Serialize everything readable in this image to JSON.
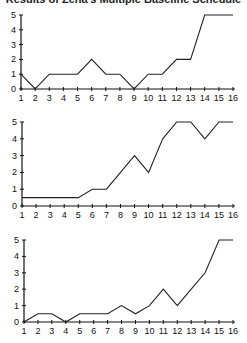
{
  "title": "Results of Zena's Multiple Baseline Schedule",
  "chart_data": [
    {
      "type": "line",
      "title": "",
      "xlabel": "",
      "ylabel": "",
      "x": [
        1,
        2,
        3,
        4,
        5,
        6,
        7,
        8,
        9,
        10,
        11,
        12,
        13,
        14,
        15,
        16
      ],
      "values": [
        1,
        0,
        1,
        1,
        1,
        2,
        1,
        1,
        0,
        1,
        1,
        2,
        2,
        5,
        5,
        5
      ],
      "ylim": [
        0,
        5
      ],
      "yticks": [
        0,
        1,
        2,
        3,
        4,
        5
      ],
      "grid": false,
      "legend": null
    },
    {
      "type": "line",
      "title": "",
      "xlabel": "",
      "ylabel": "",
      "x": [
        1,
        2,
        3,
        4,
        5,
        6,
        7,
        8,
        9,
        10,
        11,
        12,
        13,
        14,
        15,
        16
      ],
      "values": [
        0.5,
        0.5,
        0.5,
        0.5,
        0.5,
        1,
        1,
        2,
        3,
        2,
        4,
        5,
        5,
        4,
        5,
        5
      ],
      "ylim": [
        0,
        5
      ],
      "yticks": [
        0,
        1,
        2,
        3,
        4,
        5
      ],
      "grid": false,
      "legend": null
    },
    {
      "type": "line",
      "title": "",
      "xlabel": "",
      "ylabel": "",
      "x": [
        1,
        2,
        3,
        4,
        5,
        6,
        7,
        8,
        9,
        10,
        11,
        12,
        13,
        14,
        15,
        16
      ],
      "values": [
        0,
        0.5,
        0.5,
        0,
        0.5,
        0.5,
        0.5,
        1,
        0.5,
        1,
        2,
        1,
        2,
        3,
        5,
        5
      ],
      "ylim": [
        0,
        5
      ],
      "yticks": [
        0,
        1,
        2,
        3,
        4,
        5
      ],
      "grid": false,
      "legend": null
    }
  ],
  "layout": [
    {
      "x0": 21,
      "x1": 233,
      "y0": 89,
      "y5": 15
    },
    {
      "x0": 22,
      "x1": 233,
      "y0": 206,
      "y5": 122
    },
    {
      "x0": 24,
      "x1": 233,
      "y0": 322,
      "y5": 240
    }
  ]
}
